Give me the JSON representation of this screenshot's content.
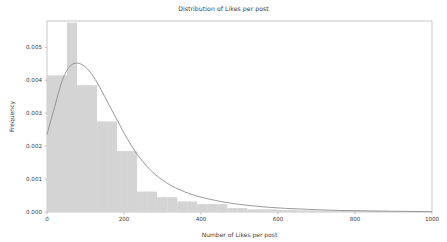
{
  "chart_data": {
    "type": "bar",
    "title": "Distribution of Likes per post",
    "xlabel": "Number of Likes per post",
    "ylabel": "Frequency",
    "xlim": [
      0,
      1000
    ],
    "ylim": [
      0,
      0.0058
    ],
    "grid": false,
    "legend": null,
    "xticks": [
      0,
      200,
      400,
      600,
      800,
      1000
    ],
    "xtick_labels": [
      "0",
      "200",
      "400",
      "600",
      "800",
      "1000"
    ],
    "yticks": [
      0.0,
      0.001,
      0.002,
      0.003,
      0.004,
      0.005
    ],
    "ytick_labels": [
      "0.000",
      "0.001",
      "0.002",
      "0.003",
      "0.004",
      "0.005"
    ],
    "bin_width": 26,
    "bin_edges": [
      0,
      26,
      52,
      78,
      104,
      130,
      156,
      182,
      208,
      234,
      260,
      286,
      312,
      338,
      364,
      390,
      416,
      442,
      468,
      494,
      520,
      546,
      572,
      598,
      624,
      650,
      676,
      702,
      728,
      754,
      780,
      806,
      832,
      858,
      884,
      910,
      936,
      962,
      988
    ],
    "categories": [
      "0-26",
      "26-52",
      "52-78",
      "78-104",
      "104-130",
      "130-156",
      "156-182",
      "182-208",
      "208-234",
      "234-260",
      "260-286",
      "286-312",
      "312-338",
      "338-364",
      "364-390",
      "390-416",
      "416-442",
      "442-468",
      "468-494",
      "494-520",
      "520-546",
      "546-572",
      "572-598",
      "598-624",
      "624-650",
      "650-676",
      "676-702",
      "702-728",
      "728-754",
      "754-780",
      "780-806",
      "806-832",
      "832-858",
      "858-884",
      "884-910",
      "910-936",
      "936-962",
      "962-988"
    ],
    "values": [
      0.00415,
      0.00415,
      0.00575,
      0.00385,
      0.00385,
      0.00275,
      0.00275,
      0.00185,
      0.00185,
      0.00062,
      0.00062,
      0.00045,
      0.00045,
      0.00032,
      0.00032,
      0.00024,
      0.00024,
      0.00024,
      0.00012,
      0.00012,
      8e-05,
      8e-05,
      8e-05,
      6e-05,
      6e-05,
      5e-05,
      5e-05,
      4e-05,
      4e-05,
      4e-05,
      4e-05,
      4e-05,
      3e-05,
      2e-05,
      0.0,
      0.0,
      0.0,
      0.0
    ],
    "series": [
      {
        "name": "histogram",
        "kind": "bar",
        "color": "#d4d4d4",
        "values": [
          0.00415,
          0.00415,
          0.00575,
          0.00385,
          0.00385,
          0.00275,
          0.00275,
          0.00185,
          0.00185,
          0.00062,
          0.00062,
          0.00045,
          0.00045,
          0.00032,
          0.00032,
          0.00024,
          0.00024,
          0.00024,
          0.00012,
          0.00012,
          8e-05,
          8e-05,
          8e-05,
          6e-05,
          6e-05,
          5e-05,
          5e-05,
          4e-05,
          4e-05,
          4e-05,
          4e-05,
          4e-05,
          3e-05,
          2e-05,
          0.0,
          0.0,
          0.0,
          0.0
        ]
      },
      {
        "name": "density-curve",
        "kind": "line",
        "color": "#8c8c8c",
        "x": [
          0,
          20,
          40,
          60,
          80,
          100,
          120,
          140,
          160,
          180,
          200,
          220,
          240,
          260,
          280,
          300,
          320,
          340,
          360,
          380,
          400,
          430,
          460,
          500,
          540,
          580,
          620,
          660,
          700,
          750,
          800,
          860,
          920,
          1000
        ],
        "y": [
          0.00235,
          0.0032,
          0.004,
          0.00443,
          0.00452,
          0.0044,
          0.00412,
          0.00372,
          0.00328,
          0.00284,
          0.0024,
          0.002,
          0.00166,
          0.00138,
          0.00115,
          0.00097,
          0.00082,
          0.0007,
          0.0006,
          0.00052,
          0.00045,
          0.00037,
          0.0003,
          0.00023,
          0.00018,
          0.00014,
          0.00011,
          9e-05,
          7e-05,
          5e-05,
          4e-05,
          3e-05,
          2e-05,
          1e-05
        ]
      }
    ]
  },
  "style": {
    "bar_color": "#d4d4d4",
    "curve_color": "#8c8c8c",
    "axis_color": "#b0b0b0",
    "text_color": "#3c3c3c",
    "background": "#ffffff"
  }
}
